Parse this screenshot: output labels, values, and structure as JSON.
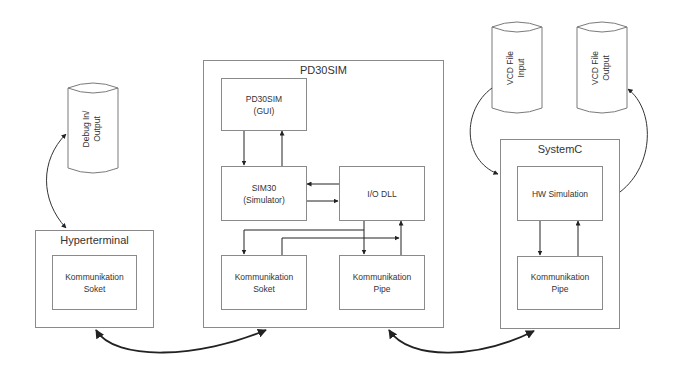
{
  "diagram": {
    "cylinders": {
      "debug": {
        "line1": "Debug In/",
        "line2": "Output"
      },
      "vcd_input": {
        "line1": "VCD File",
        "line2": "Input"
      },
      "vcd_output": {
        "line1": "VCD File",
        "line2": "Output"
      }
    },
    "hyperterminal": {
      "title": "Hyperterminal",
      "socket": {
        "line1": "Kommunikation",
        "line2": "Soket"
      }
    },
    "pd30sim": {
      "title": "PD30SIM",
      "gui": {
        "line1": "PD30SIM",
        "line2": "(GUI)"
      },
      "sim30": {
        "line1": "SIM30",
        "line2": "(Simulator)"
      },
      "io_dll": {
        "line1": "I/O DLL"
      },
      "socket": {
        "line1": "Kommunikation",
        "line2": "Soket"
      },
      "pipe": {
        "line1": "Kommunikation",
        "line2": "Pipe"
      }
    },
    "systemc": {
      "title": "SystemC",
      "hw_sim": {
        "line1": "HW Simulation"
      },
      "pipe": {
        "line1": "Kommunikation",
        "line2": "Pipe"
      }
    },
    "colors": {
      "border": "#8a8a8a",
      "arrow": "#222222"
    }
  }
}
